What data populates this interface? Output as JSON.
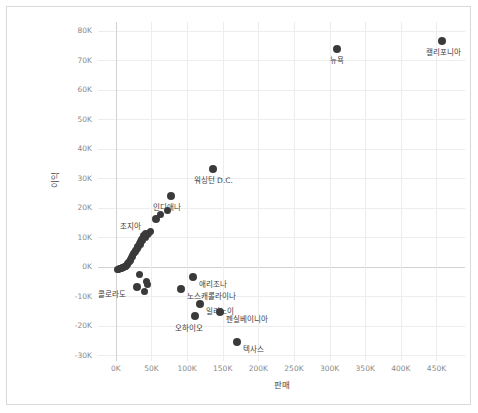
{
  "chart_data": {
    "type": "scatter",
    "title": "",
    "xlabel": "판매",
    "ylabel": "이익",
    "xlim": [
      -25000,
      490000
    ],
    "ylim": [
      -32000,
      83000
    ],
    "grid": true,
    "legend": "none",
    "xticks": [
      "0K",
      "50K",
      "100K",
      "150K",
      "200K",
      "250K",
      "300K",
      "350K",
      "400K",
      "450K"
    ],
    "xtick_values": [
      0,
      50000,
      100000,
      150000,
      200000,
      250000,
      300000,
      350000,
      400000,
      450000
    ],
    "yticks": [
      "80K",
      "70K",
      "60K",
      "50K",
      "40K",
      "30K",
      "20K",
      "10K",
      "0K",
      "-10K",
      "-20K",
      "-30K"
    ],
    "ytick_values": [
      80000,
      70000,
      60000,
      50000,
      40000,
      30000,
      20000,
      10000,
      0,
      -10000,
      -20000,
      -30000
    ],
    "point_color": "#3a3a3a",
    "labeled_points": [
      {
        "name": "캘리포니아",
        "x": 458000,
        "y": 76400,
        "label_dx": -16,
        "label_dy": 7
      },
      {
        "name": "뉴욕",
        "x": 310000,
        "y": 74000,
        "label_dx": -7,
        "label_dy": 7
      },
      {
        "name": "워싱턴 D.C.",
        "x": 136000,
        "y": 33300,
        "label_dx": -19,
        "label_dy": 7
      },
      {
        "name": "인디애나",
        "x": 78000,
        "y": 24100,
        "label_dx": -18,
        "label_dy": 7
      },
      {
        "name": "조지아",
        "x": 56000,
        "y": 16200,
        "label_dx": -36,
        "label_dy": 3
      },
      {
        "name": "콜로라도",
        "x": 30000,
        "y": -6800,
        "label_dx": -39,
        "label_dy": 3
      },
      {
        "name": "애리조나",
        "x": 108000,
        "y": -3500,
        "label_dx": 6,
        "label_dy": 3
      },
      {
        "name": "노스캐롤라이나",
        "x": 92000,
        "y": -7500,
        "label_dx": 6,
        "label_dy": 3
      },
      {
        "name": "일리노이",
        "x": 118000,
        "y": -12600,
        "label_dx": 6,
        "label_dy": 3
      },
      {
        "name": "펜실베이니아",
        "x": 146000,
        "y": -15500,
        "label_dx": 6,
        "label_dy": 3
      },
      {
        "name": "오하이오",
        "x": 111000,
        "y": -16800,
        "label_dx": -20,
        "label_dy": 8
      },
      {
        "name": "텍사스",
        "x": 170000,
        "y": -25700,
        "label_dx": 6,
        "label_dy": 3
      }
    ],
    "unlabeled_points": [
      {
        "x": 73000,
        "y": 19200
      },
      {
        "x": 63000,
        "y": 17800
      },
      {
        "x": 49000,
        "y": 11800
      },
      {
        "x": 46000,
        "y": 11200
      },
      {
        "x": 44000,
        "y": 10900
      },
      {
        "x": 41000,
        "y": 11400
      },
      {
        "x": 39000,
        "y": 10500
      },
      {
        "x": 37000,
        "y": 9700
      },
      {
        "x": 36000,
        "y": 9100
      },
      {
        "x": 34000,
        "y": 8400
      },
      {
        "x": 33000,
        "y": 7800
      },
      {
        "x": 31000,
        "y": 7000
      },
      {
        "x": 30000,
        "y": 6300
      },
      {
        "x": 28000,
        "y": 5600
      },
      {
        "x": 27000,
        "y": 5000
      },
      {
        "x": 25000,
        "y": 4300
      },
      {
        "x": 24000,
        "y": 3700
      },
      {
        "x": 22000,
        "y": 3100
      },
      {
        "x": 21000,
        "y": 2500
      },
      {
        "x": 19000,
        "y": 1900
      },
      {
        "x": 18000,
        "y": 1400
      },
      {
        "x": 16000,
        "y": 900
      },
      {
        "x": 15000,
        "y": 400
      },
      {
        "x": 13000,
        "y": 100
      },
      {
        "x": 11000,
        "y": -200
      },
      {
        "x": 9000,
        "y": -400
      },
      {
        "x": 7000,
        "y": -600
      },
      {
        "x": 5500,
        "y": -700
      },
      {
        "x": 4000,
        "y": -800
      },
      {
        "x": 2500,
        "y": -900
      },
      {
        "x": 42000,
        "y": 9900
      },
      {
        "x": 38000,
        "y": 8800
      },
      {
        "x": 35000,
        "y": 7500
      },
      {
        "x": 32000,
        "y": 6700
      },
      {
        "x": 29000,
        "y": 5900
      },
      {
        "x": 26000,
        "y": 4700
      },
      {
        "x": 23000,
        "y": 3400
      },
      {
        "x": 20000,
        "y": 2200
      },
      {
        "x": 17000,
        "y": 1100
      },
      {
        "x": 14000,
        "y": 200
      },
      {
        "x": 12000,
        "y": -100
      },
      {
        "x": 10000,
        "y": -300
      },
      {
        "x": 8000,
        "y": -500
      },
      {
        "x": 6000,
        "y": -650
      },
      {
        "x": 33000,
        "y": -2500
      },
      {
        "x": 43000,
        "y": -5200
      },
      {
        "x": 45000,
        "y": -6000
      },
      {
        "x": 40000,
        "y": -8400
      }
    ]
  }
}
